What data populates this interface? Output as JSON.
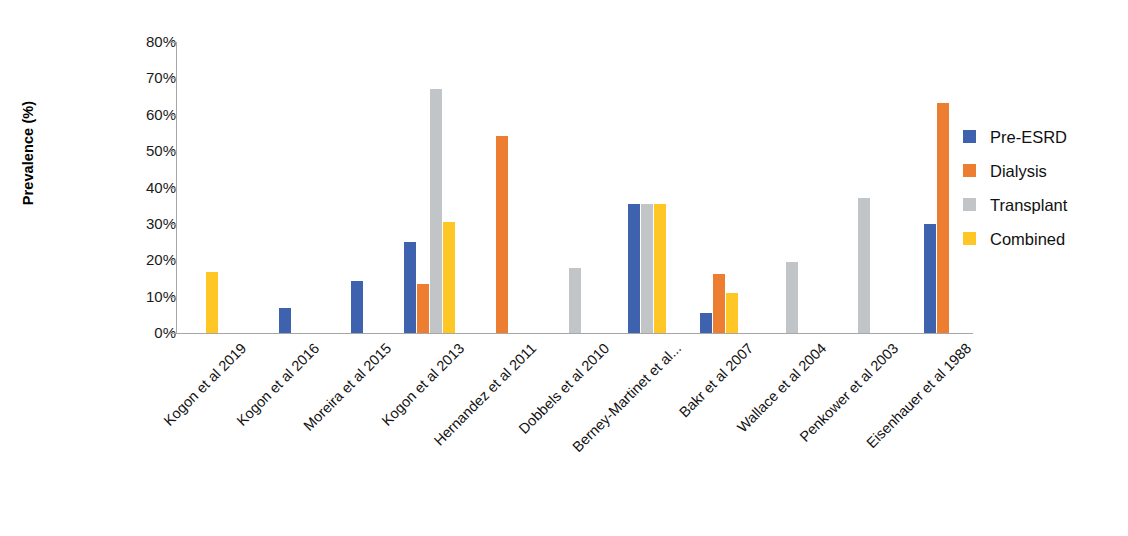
{
  "chart_data": {
    "type": "bar",
    "title": "",
    "xlabel": "",
    "ylabel": "Prevalence (%)",
    "ylim": [
      0,
      80
    ],
    "ytick_values": [
      0,
      10,
      20,
      30,
      40,
      50,
      60,
      70,
      80
    ],
    "ytick_labels": [
      "0%",
      "10%",
      "20%",
      "30%",
      "40%",
      "50%",
      "60%",
      "70%",
      "80%"
    ],
    "grid": false,
    "legend_position": "right",
    "categories": [
      "Kogon et al 2019",
      "Kogon et al 2016",
      "Moreira et al 2015",
      "Kogon et al 2013",
      "Hernandez et al 2011",
      "Dobbels et al 2010",
      "Berney-Martinet et al...",
      "Bakr et al 2007",
      "Wallace et al 2004",
      "Penkower et al 2003",
      "Eisenhauer et al 1988"
    ],
    "series": [
      {
        "name": "Pre-ESRD",
        "color": "#3E62AD",
        "values": [
          null,
          7.0,
          14.3,
          25.0,
          null,
          null,
          35.5,
          5.5,
          null,
          null,
          29.9
        ]
      },
      {
        "name": "Dialysis",
        "color": "#ED7D31",
        "values": [
          null,
          null,
          null,
          13.4,
          54.1,
          null,
          null,
          16.3,
          null,
          null,
          63.2
        ]
      },
      {
        "name": "Transplant",
        "color": "#C2C5C7",
        "values": [
          null,
          null,
          null,
          67.2,
          null,
          17.8,
          35.5,
          null,
          19.5,
          37.0,
          null
        ]
      },
      {
        "name": "Combined",
        "color": "#FFC726",
        "values": [
          16.9,
          null,
          null,
          30.4,
          null,
          null,
          35.5,
          11.0,
          null,
          null,
          null
        ]
      }
    ]
  }
}
